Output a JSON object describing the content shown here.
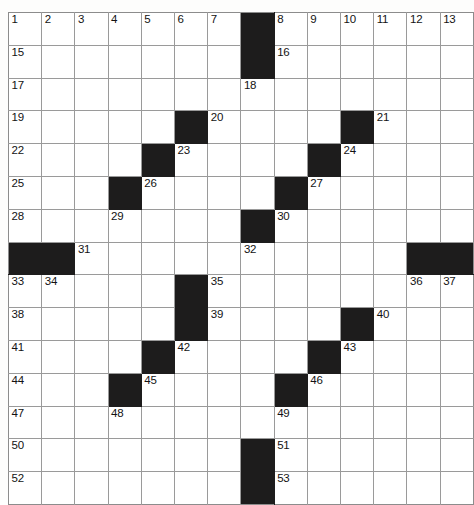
{
  "puzzle": {
    "title": "Crossword Grid",
    "columns": 14,
    "rows": 15,
    "colors": {
      "block": "#1d1c1c",
      "cell": "#ffffff",
      "gridline": "#9a9a9a",
      "border": "#8c8c8c",
      "number_text": "#131313"
    },
    "grid": [
      [
        {
          "n": "1"
        },
        {
          "n": "2"
        },
        {
          "n": "3"
        },
        {
          "n": "4"
        },
        {
          "n": "5"
        },
        {
          "n": "6"
        },
        {
          "n": "7"
        },
        {
          "block": true
        },
        {
          "n": "8"
        },
        {
          "n": "9"
        },
        {
          "n": "10"
        },
        {
          "n": "11"
        },
        {
          "n": "12"
        },
        {
          "n": "13"
        }
      ],
      [
        {
          "n": "15"
        },
        {},
        {},
        {},
        {},
        {},
        {},
        {
          "block": true
        },
        {
          "n": "16"
        },
        {},
        {},
        {},
        {},
        {}
      ],
      [
        {
          "n": "17"
        },
        {},
        {},
        {},
        {},
        {},
        {},
        {
          "n": "18"
        },
        {},
        {},
        {},
        {},
        {},
        {}
      ],
      [
        {
          "n": "19"
        },
        {},
        {},
        {},
        {},
        {
          "block": true
        },
        {
          "n": "20"
        },
        {},
        {},
        {},
        {
          "block": true
        },
        {
          "n": "21"
        },
        {},
        {}
      ],
      [
        {
          "n": "22"
        },
        {},
        {},
        {},
        {
          "block": true
        },
        {
          "n": "23"
        },
        {},
        {},
        {},
        {
          "block": true
        },
        {
          "n": "24"
        },
        {},
        {},
        {}
      ],
      [
        {
          "n": "25"
        },
        {},
        {},
        {
          "block": true
        },
        {
          "n": "26"
        },
        {},
        {},
        {},
        {
          "block": true
        },
        {
          "n": "27"
        },
        {},
        {},
        {},
        {}
      ],
      [
        {
          "n": "28"
        },
        {},
        {},
        {
          "n": "29"
        },
        {},
        {},
        {},
        {
          "block": true
        },
        {
          "n": "30"
        },
        {},
        {},
        {},
        {},
        {}
      ],
      [
        {
          "block": true
        },
        {
          "block": true
        },
        {
          "n": "31"
        },
        {},
        {},
        {},
        {},
        {
          "n": "32"
        },
        {},
        {},
        {},
        {},
        {
          "block": true
        },
        {
          "block": true
        }
      ],
      [
        {
          "n": "33"
        },
        {
          "n": "34"
        },
        {},
        {},
        {},
        {
          "block": true
        },
        {
          "n": "35"
        },
        {},
        {},
        {},
        {},
        {},
        {
          "n": "36"
        },
        {
          "n": "37"
        }
      ],
      [
        {
          "n": "38"
        },
        {},
        {},
        {},
        {},
        {
          "block": true
        },
        {
          "n": "39"
        },
        {},
        {},
        {},
        {
          "block": true
        },
        {
          "n": "40"
        },
        {},
        {}
      ],
      [
        {
          "n": "41"
        },
        {},
        {},
        {},
        {
          "block": true
        },
        {
          "n": "42"
        },
        {},
        {},
        {},
        {
          "block": true
        },
        {
          "n": "43"
        },
        {},
        {},
        {}
      ],
      [
        {
          "n": "44"
        },
        {},
        {},
        {
          "block": true
        },
        {
          "n": "45"
        },
        {},
        {},
        {},
        {
          "block": true
        },
        {
          "n": "46"
        },
        {},
        {},
        {},
        {}
      ],
      [
        {
          "n": "47"
        },
        {},
        {},
        {
          "n": "48"
        },
        {},
        {},
        {},
        {},
        {
          "n": "49"
        },
        {},
        {},
        {},
        {},
        {}
      ],
      [
        {
          "n": "50"
        },
        {},
        {},
        {},
        {},
        {},
        {},
        {
          "block": true
        },
        {
          "n": "51"
        },
        {},
        {},
        {},
        {},
        {}
      ],
      [
        {
          "n": "52"
        },
        {},
        {},
        {},
        {},
        {},
        {},
        {
          "block": true
        },
        {
          "n": "53"
        },
        {},
        {},
        {},
        {},
        {}
      ]
    ],
    "clue_numbers": [
      "1",
      "2",
      "3",
      "4",
      "5",
      "6",
      "7",
      "8",
      "9",
      "10",
      "11",
      "12",
      "13",
      "14",
      "15",
      "16",
      "17",
      "18",
      "19",
      "20",
      "21",
      "22",
      "23",
      "24",
      "25",
      "26",
      "27",
      "28",
      "29",
      "30",
      "31",
      "32",
      "33",
      "34",
      "35",
      "36",
      "37",
      "38",
      "39",
      "40",
      "41",
      "42",
      "43",
      "44",
      "45",
      "46",
      "47",
      "48",
      "49",
      "50",
      "51",
      "52",
      "53"
    ]
  }
}
